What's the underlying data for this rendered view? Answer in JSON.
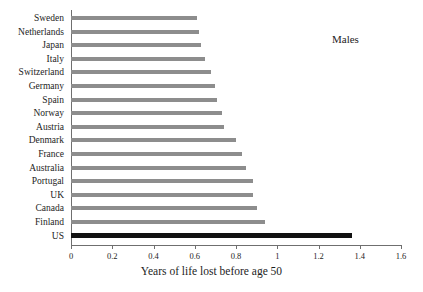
{
  "series_title": "Males",
  "chart_data": {
    "type": "bar",
    "orientation": "horizontal",
    "title": "Males",
    "xlabel": "Years of life lost before age 50",
    "ylabel": "",
    "xlim": [
      0,
      1.6
    ],
    "grid": false,
    "legend": null,
    "tick_labels": [
      "0",
      "0.2",
      "0.4",
      "0.6",
      "0.8",
      "1",
      "1.2",
      "1.4",
      "1.6"
    ],
    "tick_values": [
      0,
      0.2,
      0.4,
      0.6,
      0.8,
      1,
      1.2,
      1.4,
      1.6
    ],
    "categories": [
      "Sweden",
      "Netherlands",
      "Japan",
      "Italy",
      "Switzerland",
      "Germany",
      "Spain",
      "Norway",
      "Austria",
      "Denmark",
      "France",
      "Australia",
      "Portugal",
      "UK",
      "Canada",
      "Finland",
      "US"
    ],
    "values": [
      0.61,
      0.62,
      0.63,
      0.65,
      0.68,
      0.7,
      0.71,
      0.73,
      0.74,
      0.8,
      0.83,
      0.85,
      0.88,
      0.88,
      0.9,
      0.94,
      1.36
    ],
    "bar_color": "#8d8d8d",
    "highlight_color": "#111111",
    "highlight_category": "US"
  }
}
